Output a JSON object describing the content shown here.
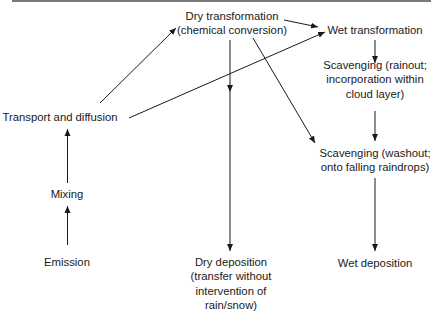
{
  "diagram": {
    "type": "flowchart",
    "colors": {
      "line": "#1a1a1a",
      "text": "#1a1a1a",
      "border": "#7a7a7a",
      "background": "#ffffff"
    },
    "nodes": {
      "emission": {
        "lines": [
          "Emission"
        ]
      },
      "mixing": {
        "lines": [
          "Mixing"
        ]
      },
      "transport": {
        "lines": [
          "Transport and diffusion"
        ]
      },
      "dry_transformation": {
        "lines": [
          "Dry transformation",
          "(chemical conversion)"
        ]
      },
      "wet_transformation": {
        "lines": [
          "Wet transformation"
        ]
      },
      "scavenging_rainout": {
        "lines": [
          "Scavenging (rainout;",
          "incorporation within",
          "cloud layer)"
        ]
      },
      "scavenging_washout": {
        "lines": [
          "Scavenging (washout;",
          "onto falling raindrops)"
        ]
      },
      "dry_deposition": {
        "lines": [
          "Dry deposition",
          "(transfer without",
          "intervention of",
          "rain/snow)"
        ]
      },
      "wet_deposition": {
        "lines": [
          "Wet deposition"
        ]
      }
    },
    "edges": [
      {
        "from": "Emission",
        "to": "Mixing"
      },
      {
        "from": "Mixing",
        "to": "Transport and diffusion"
      },
      {
        "from": "Transport and diffusion",
        "to": "Dry transformation"
      },
      {
        "from": "Transport and diffusion",
        "to": "Wet transformation"
      },
      {
        "from": "Dry transformation",
        "to": "Wet transformation"
      },
      {
        "from": "Dry transformation",
        "to": "Dry deposition"
      },
      {
        "from": "Dry transformation",
        "to": "Scavenging (washout)"
      },
      {
        "from": "Wet transformation",
        "to": "Scavenging (rainout)"
      },
      {
        "from": "Scavenging (rainout)",
        "to": "Scavenging (washout)"
      },
      {
        "from": "Scavenging (washout)",
        "to": "Wet deposition"
      }
    ]
  }
}
